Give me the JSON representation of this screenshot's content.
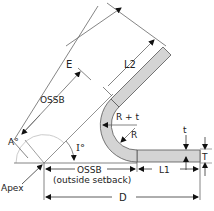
{
  "diagram": {
    "colors": {
      "part_fill": "#d4d4d4",
      "part_stroke": "#555555",
      "line": "#444444",
      "arc": "#cccccc",
      "text": "#222222"
    },
    "labels": {
      "E": "E",
      "L2": "L2",
      "OSSB_arm": "OSSB",
      "A_angle": "A°",
      "I_angle": "I°",
      "R_plus_t": "R + t",
      "R": "R",
      "t": "t",
      "T": "T",
      "apex": "Apex",
      "OSSB_base": "OSSB",
      "OSSB_note": "(outside setback)",
      "L1": "L1",
      "D": "D"
    }
  }
}
